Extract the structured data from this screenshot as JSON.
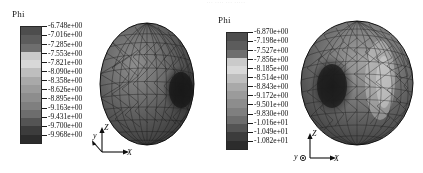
{
  "figure": {
    "top_text_remnant": "··· ···· ··· ·····",
    "background_color": "#fdfdfd"
  },
  "panels": [
    {
      "id": "left",
      "colorbar": {
        "title": "Phi",
        "orientation": "vertical",
        "colormap": "grayscale",
        "swatch_colors": [
          "#4e4e4e",
          "#5d5d5d",
          "#6e6e6e",
          "#c9c9c9",
          "#d6d6d6",
          "#bdbdbd",
          "#a8a8a8",
          "#9a9a9a",
          "#8d8d8d",
          "#7f7f7f",
          "#6d6d6d",
          "#555555",
          "#3d3d3d",
          "#2e2e2e"
        ],
        "tick_labels": [
          "-6.748e+00",
          "-7.016e+00",
          "-7.285e+00",
          "-7.553e+00",
          "-7.821e+00",
          "-8.090e+00",
          "-8.358e+00",
          "-8.626e+00",
          "-8.895e+00",
          "-9.163e+00",
          "-9.431e+00",
          "-9.700e+00",
          "-9.968e+00"
        ],
        "max_value": "-6.748e+00",
        "min_value": "-9.968e+00"
      },
      "axes_triad": {
        "z_label": "Z",
        "y_label": "y",
        "x_label": "X",
        "y_style": "diagonal-arrow"
      },
      "object": {
        "name": "triangulated-ellipsoid-mesh",
        "shape": "prolate-ellipsoid",
        "dark_spot_side": "right"
      }
    },
    {
      "id": "right",
      "colorbar": {
        "title": "Phi",
        "orientation": "vertical",
        "colormap": "grayscale",
        "swatch_colors": [
          "#4e4e4e",
          "#5d5d5d",
          "#6e6e6e",
          "#c9c9c9",
          "#d6d6d6",
          "#bdbdbd",
          "#a8a8a8",
          "#9a9a9a",
          "#8d8d8d",
          "#7f7f7f",
          "#6d6d6d",
          "#555555",
          "#3d3d3d",
          "#2e2e2e"
        ],
        "tick_labels": [
          "-6.870e+00",
          "-7.198e+00",
          "-7.527e+00",
          "-7.856e+00",
          "-8.185e+00",
          "-8.514e+00",
          "-8.843e+00",
          "-9.172e+00",
          "-9.501e+00",
          "-9.830e+00",
          "-1.016e+01",
          "-1.049e+01",
          "-1.082e+01"
        ],
        "max_value": "-6.870e+00",
        "min_value": "-1.082e+01"
      },
      "axes_triad": {
        "z_label": "Z",
        "y_label": "y",
        "x_label": "X",
        "y_style": "out-of-screen-circle"
      },
      "object": {
        "name": "triangulated-sphere-mesh",
        "shape": "sphere",
        "dark_spot_side": "left"
      }
    }
  ]
}
